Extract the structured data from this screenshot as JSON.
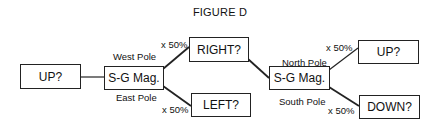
{
  "title": "FIGURE D",
  "nodes": {
    "start": "UP?",
    "sg1": "S-G Mag.",
    "right": "RIGHT?",
    "left": "LEFT?",
    "sg2": "S-G Mag.",
    "up": "UP?",
    "down": "DOWN?"
  },
  "edges": {
    "west_pole": "West Pole",
    "east_pole": "East Pole",
    "north_pole": "North Pole",
    "south_pole": "South Pole",
    "right_pct": "x 50%",
    "left_pct": "x 50%",
    "up_pct": "x 50%",
    "down_pct": "x 50%"
  }
}
